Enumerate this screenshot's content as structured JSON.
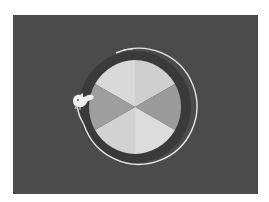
{
  "game": {
    "scene": "rotating-wheel",
    "background_color": "#4b4b4b",
    "frame_color": "#ffffff",
    "wheel": {
      "center": [
        122,
        92
      ],
      "radius": 47,
      "ring_radius": 57,
      "ring_color": "#3a3a3a",
      "orbit_arc_color": "#e6e6e6",
      "segments": [
        {
          "index": 0,
          "label": "top-left",
          "color": "#d9d9d9"
        },
        {
          "index": 1,
          "label": "top-right",
          "color": "#cfcfcf"
        },
        {
          "index": 2,
          "label": "right",
          "color": "#9b9b9b"
        },
        {
          "index": 3,
          "label": "bottom-right",
          "color": "#dcdcdc"
        },
        {
          "index": 4,
          "label": "bottom-left",
          "color": "#d2d2d2"
        },
        {
          "index": 5,
          "label": "left",
          "color": "#9e9e9e"
        }
      ]
    },
    "player": {
      "name": "squirrel",
      "color": "#eeeeee",
      "position": [
        66,
        83
      ]
    },
    "footer_text": ""
  }
}
